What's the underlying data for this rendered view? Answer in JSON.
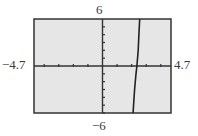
{
  "chart_data": {
    "type": "line",
    "title": "",
    "xlabel": "",
    "ylabel": "",
    "window": {
      "xmin": -4.7,
      "xmax": 4.7,
      "ymin": -6,
      "ymax": 6,
      "xscale": 1,
      "yscale": 1
    },
    "xlim": [
      -4.7,
      4.7
    ],
    "ylim": [
      -6,
      6
    ],
    "grid": false,
    "legend": null,
    "axis_labels": {
      "xmin": "−4.7",
      "xmax": "4.7",
      "ymin": "−6",
      "ymax": "6"
    },
    "x_ticks": [
      -4,
      -3,
      -2,
      -1,
      1,
      2,
      3,
      4
    ],
    "y_ticks": [
      -6,
      -5,
      -4,
      -3,
      -2,
      -1,
      1,
      2,
      3,
      4,
      5
    ],
    "series": [
      {
        "name": "graph",
        "style": "steep nearly vertical line (pixelated calculator trace)",
        "points": [
          {
            "x": 2.1,
            "y": -6
          },
          {
            "x": 2.15,
            "y": -4.5
          },
          {
            "x": 2.2,
            "y": -3
          },
          {
            "x": 2.3,
            "y": -1
          },
          {
            "x": 2.36,
            "y": 0
          },
          {
            "x": 2.45,
            "y": 2
          },
          {
            "x": 2.5,
            "y": 4
          },
          {
            "x": 2.55,
            "y": 6
          }
        ]
      }
    ],
    "colors": {
      "plot_background": "#e6e6e6",
      "frame": "#333333",
      "axes": "#333333",
      "curve": "#222222"
    }
  }
}
